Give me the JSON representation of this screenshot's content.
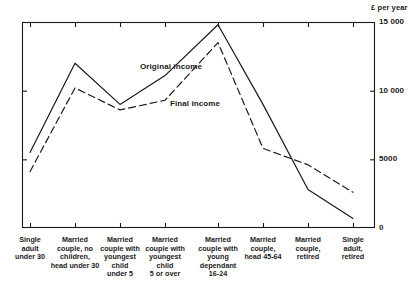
{
  "chart_data": {
    "type": "line",
    "title": "",
    "xlabel": "",
    "ylabel": "£ per year",
    "ylim": [
      0,
      15000
    ],
    "grid": false,
    "legend_position": "inline-annotation",
    "y_ticks": [
      "0",
      "5000",
      "10 000",
      "15 000"
    ],
    "y_tick_values": [
      0,
      5000,
      10000,
      15000
    ],
    "categories": [
      "Single\nadult\nunder 30",
      "Married\ncouple, no\nchildren,\nhead under 30",
      "Married\ncouple with\nyoungest\nchild\nunder 5",
      "Married\ncouple with\nyoungest\nchild\n5 or over",
      "Married\ncouple with\nyoung\ndependant\n16-24",
      "Married\ncouple,\nhead 45-64",
      "Married\ncouple,\nretired",
      "Single\nadult,\nretired"
    ],
    "series": [
      {
        "name": "Original income",
        "style": "solid",
        "color": "#1a1a1a",
        "values": [
          5500,
          12000,
          9000,
          11100,
          14800,
          9000,
          2800,
          700
        ]
      },
      {
        "name": "Final income",
        "style": "dashed",
        "color": "#1a1a1a",
        "values": [
          4100,
          10200,
          8600,
          9300,
          13500,
          5800,
          4600,
          2600
        ]
      }
    ],
    "annotations": [
      {
        "text": "Original\nincome",
        "x": 140,
        "y": 62
      },
      {
        "text": "Final\nincome",
        "x": 170,
        "y": 99
      }
    ]
  },
  "axis": {
    "unit_label": "£ per year"
  }
}
